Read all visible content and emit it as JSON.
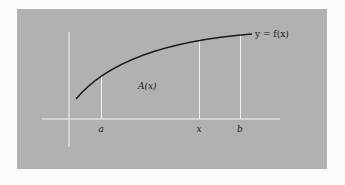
{
  "figure": {
    "curve_label": "y = f(x)",
    "area_label": "A(x)",
    "tick_labels": {
      "a": "a",
      "x": "x",
      "b": "b"
    }
  },
  "colors": {
    "panel": "#b1b1b1",
    "background": "#fbfbfb",
    "axes": "#f2f2f2",
    "curve": "#1a1a1a"
  }
}
